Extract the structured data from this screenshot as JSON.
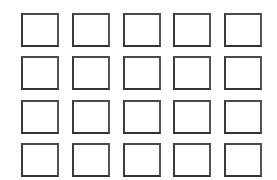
{
  "canvas": {
    "width": 277,
    "height": 180,
    "background_color": "#ffffff",
    "description": "Grid of empty outlined squares"
  },
  "grid": {
    "columns": 5,
    "rows": 4,
    "total_cells": 20,
    "cell_width": 38,
    "cell_height": 34,
    "column_gap": 13,
    "row_gap": 9,
    "offset_left": 21,
    "offset_top": 13,
    "border_width": 2,
    "border_color": "#3b3b3b",
    "cell_fill_color": "#ffffff",
    "cells": [
      {
        "row": 1,
        "col": 1,
        "label": ""
      },
      {
        "row": 1,
        "col": 2,
        "label": ""
      },
      {
        "row": 1,
        "col": 3,
        "label": ""
      },
      {
        "row": 1,
        "col": 4,
        "label": ""
      },
      {
        "row": 1,
        "col": 5,
        "label": ""
      },
      {
        "row": 2,
        "col": 1,
        "label": ""
      },
      {
        "row": 2,
        "col": 2,
        "label": ""
      },
      {
        "row": 2,
        "col": 3,
        "label": ""
      },
      {
        "row": 2,
        "col": 4,
        "label": ""
      },
      {
        "row": 2,
        "col": 5,
        "label": ""
      },
      {
        "row": 3,
        "col": 1,
        "label": ""
      },
      {
        "row": 3,
        "col": 2,
        "label": ""
      },
      {
        "row": 3,
        "col": 3,
        "label": ""
      },
      {
        "row": 3,
        "col": 4,
        "label": ""
      },
      {
        "row": 3,
        "col": 5,
        "label": ""
      },
      {
        "row": 4,
        "col": 1,
        "label": ""
      },
      {
        "row": 4,
        "col": 2,
        "label": ""
      },
      {
        "row": 4,
        "col": 3,
        "label": ""
      },
      {
        "row": 4,
        "col": 4,
        "label": ""
      },
      {
        "row": 4,
        "col": 5,
        "label": ""
      }
    ]
  }
}
